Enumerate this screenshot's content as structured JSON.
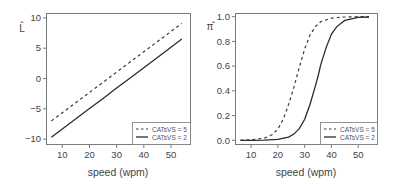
{
  "chart_data": [
    {
      "type": "line",
      "title": "",
      "xlabel": "speed (wpm)",
      "ylabel": "L̂",
      "xlim": [
        4,
        57
      ],
      "ylim": [
        -10.8,
        10.8
      ],
      "xticks": [
        10,
        20,
        30,
        40,
        50
      ],
      "yticks": [
        -10,
        -5,
        0,
        5,
        10
      ],
      "xtick_labels": [
        "10",
        "20",
        "30",
        "40",
        "50"
      ],
      "ytick_labels": [
        "−10",
        "−5",
        "0",
        "5",
        "10"
      ],
      "grid": false,
      "legend_position": "bottom-right",
      "series": [
        {
          "name": "CATsVS = 5",
          "style": "dashed",
          "x": [
            6,
            10,
            15,
            20,
            25,
            30,
            35,
            40,
            45,
            50,
            54
          ],
          "values": [
            -6.99,
            -5.65,
            -3.98,
            -2.3,
            -0.63,
            1.05,
            2.73,
            4.4,
            6.08,
            7.75,
            9.09
          ]
        },
        {
          "name": "CATsVS = 2",
          "style": "solid",
          "x": [
            6,
            10,
            15,
            20,
            25,
            30,
            35,
            40,
            45,
            50,
            54
          ],
          "values": [
            -9.68,
            -8.33,
            -6.65,
            -4.96,
            -3.28,
            -1.59,
            0.1,
            1.78,
            3.47,
            5.15,
            6.5
          ]
        }
      ]
    },
    {
      "type": "line",
      "title": "",
      "xlabel": "speed (wpm)",
      "ylabel": "π̂",
      "xlim": [
        4,
        57
      ],
      "ylim": [
        -0.03,
        1.03
      ],
      "xticks": [
        10,
        20,
        30,
        40,
        50
      ],
      "yticks": [
        0.0,
        0.2,
        0.4,
        0.6,
        0.8,
        1.0
      ],
      "xtick_labels": [
        "10",
        "20",
        "30",
        "40",
        "50"
      ],
      "ytick_labels": [
        "0.0",
        "0.2",
        "0.4",
        "0.6",
        "0.8",
        "1.0"
      ],
      "grid": false,
      "legend_position": "bottom-right",
      "series": [
        {
          "name": "CATsVS = 5",
          "style": "dashed",
          "x": [
            6,
            10,
            15,
            18,
            20,
            22,
            24,
            26,
            27,
            28,
            30,
            32,
            34,
            36,
            40,
            45,
            50,
            54
          ],
          "values": [
            0.001,
            0.004,
            0.018,
            0.047,
            0.091,
            0.17,
            0.29,
            0.43,
            0.51,
            0.59,
            0.74,
            0.85,
            0.92,
            0.96,
            0.988,
            0.998,
            1.0,
            1.0
          ]
        },
        {
          "name": "CATsVS = 2",
          "style": "solid",
          "x": [
            6,
            10,
            15,
            20,
            24,
            26,
            28,
            30,
            32,
            34,
            35,
            36,
            38,
            40,
            42,
            45,
            50,
            54
          ],
          "values": [
            0.0,
            0.0,
            0.001,
            0.007,
            0.026,
            0.05,
            0.095,
            0.17,
            0.29,
            0.44,
            0.52,
            0.61,
            0.75,
            0.86,
            0.92,
            0.97,
            0.994,
            0.998
          ]
        }
      ]
    }
  ],
  "panels": [
    {
      "xlabel": "speed (wpm)",
      "ylabel": "L̂",
      "legend": [
        "CATsVS = 5",
        "CATsVS = 2"
      ]
    },
    {
      "xlabel": "speed (wpm)",
      "ylabel": "π̂",
      "legend": [
        "CATsVS = 5",
        "CATsVS = 2"
      ]
    }
  ]
}
